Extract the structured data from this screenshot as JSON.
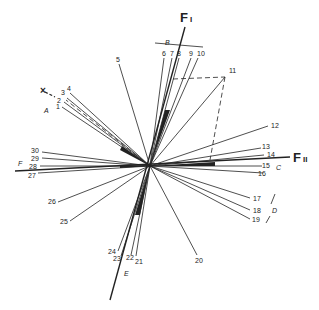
{
  "diagram": {
    "type": "factor-loading-vector-plot",
    "axes": {
      "f1": {
        "label": "F",
        "subscript": "I"
      },
      "f2": {
        "label": "F",
        "subscript": "II"
      }
    },
    "groups": [
      "A",
      "B",
      "C",
      "D",
      "E",
      "F"
    ],
    "marker": "×",
    "vectors": [
      {
        "id": "1"
      },
      {
        "id": "2"
      },
      {
        "id": "3"
      },
      {
        "id": "4"
      },
      {
        "id": "5"
      },
      {
        "id": "6"
      },
      {
        "id": "7"
      },
      {
        "id": "8"
      },
      {
        "id": "9"
      },
      {
        "id": "10"
      },
      {
        "id": "11"
      },
      {
        "id": "12"
      },
      {
        "id": "13"
      },
      {
        "id": "14"
      },
      {
        "id": "15"
      },
      {
        "id": "16"
      },
      {
        "id": "17"
      },
      {
        "id": "18"
      },
      {
        "id": "19"
      },
      {
        "id": "20"
      },
      {
        "id": "21"
      },
      {
        "id": "22"
      },
      {
        "id": "23"
      },
      {
        "id": "24"
      },
      {
        "id": "25"
      },
      {
        "id": "26"
      },
      {
        "id": "27"
      },
      {
        "id": "28"
      },
      {
        "id": "29"
      },
      {
        "id": "30"
      }
    ]
  }
}
